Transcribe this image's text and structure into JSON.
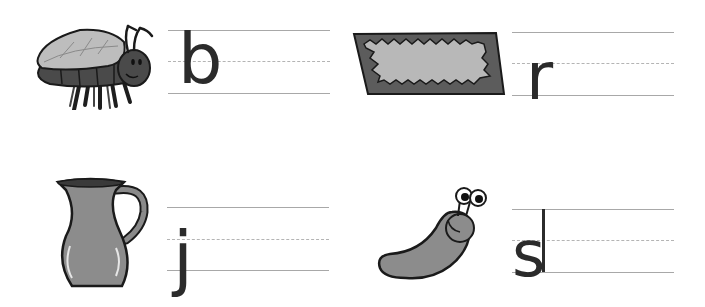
{
  "worksheet": {
    "items": [
      {
        "picture": "fly",
        "letter": "b"
      },
      {
        "picture": "rug",
        "letter": "r"
      },
      {
        "picture": "jug",
        "letter": "j"
      },
      {
        "picture": "slug",
        "letter": "s"
      }
    ]
  }
}
